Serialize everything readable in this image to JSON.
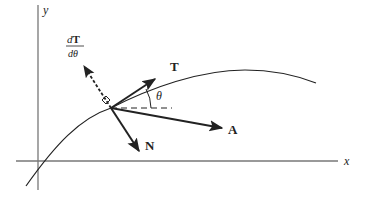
{
  "diagram": {
    "axes": {
      "x_label": "x",
      "y_label": "y"
    },
    "vectors": {
      "tangent": {
        "label": "T"
      },
      "acceleration": {
        "label": "A"
      },
      "normal": {
        "label": "N"
      },
      "derivative": {
        "numerator": "dT",
        "numerator_d": "d",
        "numerator_T": "T",
        "denominator": "dθ"
      }
    },
    "angle": {
      "label": "θ"
    },
    "colors": {
      "stroke": "#222222",
      "axis": "#777777",
      "background": "#ffffff"
    }
  }
}
